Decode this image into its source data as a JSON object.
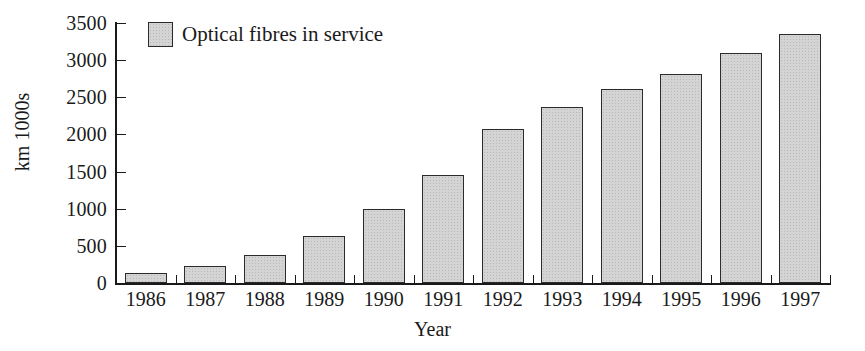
{
  "chart_data": {
    "type": "bar",
    "title": "",
    "xlabel": "Year",
    "ylabel": "km 1000s",
    "categories": [
      "1986",
      "1987",
      "1988",
      "1989",
      "1990",
      "1991",
      "1992",
      "1993",
      "1994",
      "1995",
      "1996",
      "1997"
    ],
    "values": [
      135,
      230,
      375,
      630,
      995,
      1460,
      2070,
      2370,
      2610,
      2810,
      3100,
      3350
    ],
    "series": [
      {
        "name": "Optical fibres in service",
        "values": [
          135,
          230,
          375,
          630,
          995,
          1460,
          2070,
          2370,
          2610,
          2810,
          3100,
          3350
        ]
      }
    ],
    "ylim": [
      0,
      3500
    ],
    "ytick_values": [
      0,
      500,
      1000,
      1500,
      2000,
      2500,
      3000,
      3500
    ],
    "ytick_labels": [
      "0",
      "500",
      "1000",
      "1500",
      "2000",
      "2500",
      "3000",
      "3500"
    ],
    "grid": false,
    "legend_position": "top-left",
    "bar_fill_color": "#d4d4d4",
    "bar_edge_color": "#2b2b2b",
    "axis_color": "#1a1a1a"
  },
  "legend": {
    "entries": [
      {
        "label": "Optical fibres in service",
        "color": "#d4d4d4"
      }
    ]
  },
  "axes": {
    "y_title": "km 1000s",
    "x_title": "Year"
  }
}
